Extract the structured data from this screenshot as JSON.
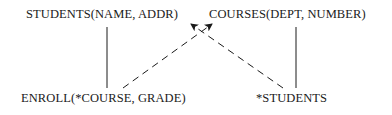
{
  "diagram": {
    "type": "schema-dependency-graph",
    "nodes": [
      {
        "id": "students",
        "label": "STUDENTS(NAME, ADDR)"
      },
      {
        "id": "courses",
        "label": "COURSES(DEPT, NUMBER)"
      },
      {
        "id": "enroll",
        "label": "ENROLL(*COURSE, GRADE)"
      },
      {
        "id": "star-students",
        "label": "*STUDENTS"
      }
    ],
    "edges": [
      {
        "from": "students",
        "to": "enroll",
        "style": "solid",
        "arrow": false
      },
      {
        "from": "courses",
        "to": "star-students",
        "style": "solid",
        "arrow": false
      },
      {
        "from": "enroll",
        "to": "courses",
        "style": "dashed",
        "arrow": true
      },
      {
        "from": "star-students",
        "to": "students",
        "style": "dashed",
        "arrow": true
      }
    ],
    "colors": {
      "line": "#1a1a1a",
      "text": "#1a1a1a",
      "background": "#ffffff"
    }
  }
}
